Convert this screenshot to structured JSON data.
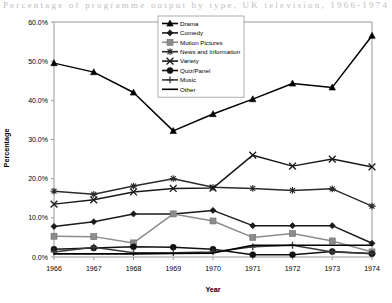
{
  "artifact_text": "Percentage of programme output by type, UK television, 1966-1974",
  "chart_data": {
    "type": "line",
    "title": "",
    "xlabel": "Year",
    "ylabel": "Percentage",
    "categories": [
      "1966",
      "1967",
      "1968",
      "1969",
      "1970",
      "1971",
      "1972",
      "1973",
      "1974"
    ],
    "ylim": [
      0,
      60
    ],
    "ytick_labels": [
      "0.0%",
      "10.0%",
      "20.0%",
      "30.0%",
      "40.0%",
      "50.0%",
      "60.0%"
    ],
    "ytick_values": [
      0,
      10,
      20,
      30,
      40,
      50,
      60
    ],
    "grid": false,
    "legend_position": "top-center-inside",
    "series": [
      {
        "name": "Drama",
        "marker": "triangle",
        "color": "#000000",
        "values": [
          49.5,
          47.2,
          42.0,
          32.2,
          36.5,
          40.3,
          44.3,
          43.3,
          56.5
        ]
      },
      {
        "name": "Comedy",
        "marker": "diamond",
        "color": "#1a1a1a",
        "values": [
          7.8,
          9.0,
          11.0,
          11.0,
          11.9,
          8.0,
          8.0,
          8.0,
          3.5
        ]
      },
      {
        "name": "Motion Pictures",
        "marker": "square-gray",
        "color": "#8c8c8c",
        "values": [
          5.3,
          5.2,
          3.6,
          11.0,
          9.2,
          5.0,
          6.0,
          4.1,
          1.3
        ]
      },
      {
        "name": "News and Information",
        "marker": "asterisk",
        "color": "#2b2b2b",
        "values": [
          16.8,
          16.0,
          18.1,
          20.0,
          17.8,
          17.5,
          17.0,
          17.4,
          13.0
        ]
      },
      {
        "name": "Variety",
        "marker": "cross",
        "color": "#1a1a1a",
        "values": [
          13.5,
          14.6,
          16.6,
          17.5,
          17.6,
          26.0,
          23.2,
          25.0,
          23.0
        ]
      },
      {
        "name": "Quiz/Panel",
        "marker": "circle",
        "color": "#111111",
        "values": [
          2.0,
          2.3,
          2.6,
          2.5,
          2.0,
          0.6,
          0.6,
          1.4,
          0.8
        ]
      },
      {
        "name": "Music",
        "marker": "plus",
        "color": "#3a3a3a",
        "values": [
          1.3,
          2.5,
          1.1,
          1.1,
          1.3,
          2.6,
          3.0,
          1.3,
          0.9
        ]
      },
      {
        "name": "Other",
        "marker": "none",
        "color": "#000000",
        "values": [
          0.8,
          0.8,
          0.8,
          0.9,
          1.0,
          3.0,
          3.0,
          3.0,
          3.0
        ]
      }
    ]
  }
}
